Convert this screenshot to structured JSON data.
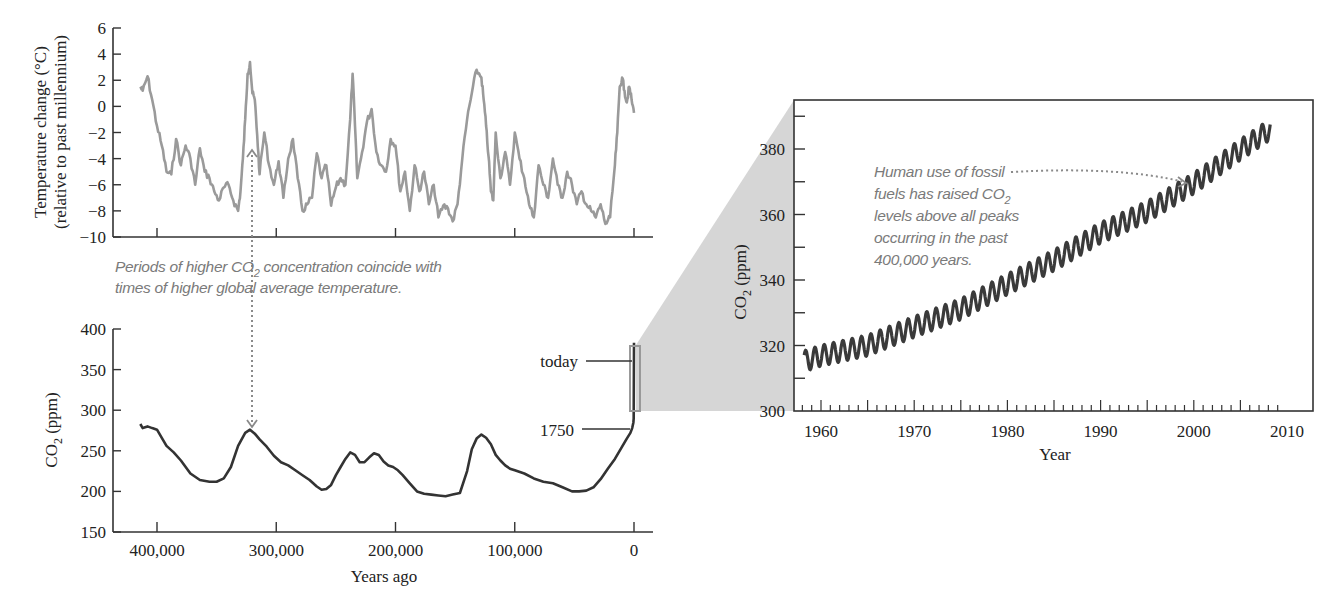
{
  "chart_data": [
    {
      "id": "temperature",
      "type": "line",
      "title": "",
      "xlabel": "",
      "ylabel": "Temperature change (°C)",
      "ylabel_line2": "(relative to past millennium)",
      "ylim": [
        -10,
        6
      ],
      "xlim": [
        425000,
        -5000
      ],
      "x_reversed": true,
      "yticks": [
        6,
        4,
        2,
        0,
        -2,
        -4,
        -6,
        -8,
        -10
      ],
      "ytick_labels": [
        "6",
        "4",
        "2",
        "0",
        "−2",
        "−4",
        "−6",
        "−8",
        "−10"
      ],
      "xticks": [
        400000,
        300000,
        200000,
        100000,
        0
      ],
      "grid": false,
      "line_color": "#9a9a9a",
      "x": [
        414000,
        412000,
        408000,
        404000,
        400000,
        396000,
        392000,
        388000,
        384000,
        380000,
        376000,
        372000,
        368000,
        364000,
        360000,
        356000,
        352000,
        348000,
        344000,
        340000,
        336000,
        332000,
        330000,
        328000,
        326000,
        324000,
        322000,
        320000,
        318000,
        316000,
        314000,
        310000,
        306000,
        302000,
        298000,
        294000,
        290000,
        286000,
        282000,
        278000,
        274000,
        270000,
        266000,
        262000,
        258000,
        254000,
        250000,
        246000,
        242000,
        238000,
        236000,
        234000,
        232000,
        228000,
        224000,
        220000,
        216000,
        212000,
        208000,
        204000,
        200000,
        196000,
        192000,
        188000,
        184000,
        180000,
        176000,
        172000,
        168000,
        164000,
        160000,
        156000,
        152000,
        148000,
        144000,
        140000,
        136000,
        132000,
        128000,
        126000,
        124000,
        122000,
        120000,
        118000,
        116000,
        112000,
        108000,
        104000,
        100000,
        96000,
        92000,
        88000,
        84000,
        80000,
        76000,
        72000,
        68000,
        64000,
        60000,
        56000,
        52000,
        48000,
        44000,
        40000,
        36000,
        32000,
        28000,
        24000,
        20000,
        16000,
        14000,
        12000,
        10000,
        8000,
        6000,
        4000,
        2000,
        0
      ],
      "values": [
        1.5,
        1.2,
        2.3,
        0.5,
        -1.5,
        -3,
        -5,
        -5.2,
        -2.5,
        -4.5,
        -3,
        -4,
        -6,
        -3.2,
        -5,
        -5.5,
        -6.5,
        -7.2,
        -6.2,
        -6,
        -7.2,
        -8,
        -6.5,
        -4,
        -1,
        2.5,
        3.4,
        1,
        0.5,
        -2.2,
        -5.2,
        -2,
        -4.5,
        -6,
        -4.2,
        -7,
        -4,
        -2.5,
        -5.5,
        -8,
        -7.5,
        -7,
        -3.6,
        -5.5,
        -4.5,
        -7.6,
        -6.2,
        -5.5,
        -6,
        -1,
        2.5,
        -1.5,
        -5.5,
        -3.5,
        -1.2,
        -0.2,
        -3.5,
        -4.5,
        -5,
        -2.5,
        -3,
        -6.5,
        -5,
        -8,
        -4.5,
        -6.5,
        -5,
        -7.5,
        -6,
        -8.5,
        -7.6,
        -7.8,
        -8.8,
        -7.5,
        -4,
        -1,
        1,
        2.8,
        2.2,
        0.5,
        -1.5,
        -3.8,
        -6.5,
        -7.2,
        -2,
        -5.5,
        -3.5,
        -6,
        -2,
        -4,
        -5.5,
        -7.5,
        -8.5,
        -4.5,
        -6,
        -7,
        -4,
        -6,
        -7,
        -5,
        -6,
        -7.5,
        -6.5,
        -7.5,
        -8,
        -8.5,
        -7.5,
        -9,
        -8.5,
        -4.5,
        -2,
        1.5,
        2.2,
        1.2,
        0.3,
        1.5,
        0.5,
        -0.5
      ]
    },
    {
      "id": "co2-paleo",
      "type": "line",
      "title": "",
      "xlabel": "Years ago",
      "ylabel": "CO2 (ppm)",
      "ylim": [
        150,
        400
      ],
      "xlim": [
        425000,
        -5000
      ],
      "x_reversed": true,
      "yticks": [
        400,
        350,
        300,
        250,
        200,
        150
      ],
      "xticks": [
        400000,
        300000,
        200000,
        100000,
        0
      ],
      "xtick_labels": [
        "400,000",
        "300,000",
        "200,000",
        "100,000",
        "0"
      ],
      "grid": false,
      "line_color": "#333333",
      "x": [
        414000,
        412000,
        408000,
        404000,
        400000,
        396000,
        392000,
        386000,
        380000,
        372000,
        364000,
        356000,
        350000,
        344000,
        338000,
        332000,
        326000,
        322000,
        318000,
        314000,
        308000,
        302000,
        296000,
        290000,
        284000,
        278000,
        272000,
        266000,
        262000,
        258000,
        254000,
        250000,
        246000,
        242000,
        238000,
        234000,
        230000,
        226000,
        222000,
        218000,
        214000,
        210000,
        206000,
        202000,
        198000,
        194000,
        188000,
        182000,
        176000,
        170000,
        164000,
        158000,
        152000,
        146000,
        140000,
        136000,
        132000,
        128000,
        124000,
        120000,
        116000,
        112000,
        108000,
        104000,
        100000,
        92000,
        84000,
        76000,
        68000,
        60000,
        52000,
        46000,
        40000,
        34000,
        28000,
        22000,
        16000,
        10000,
        6000,
        3000,
        1500,
        500,
        250
      ],
      "values": [
        283,
        278,
        280,
        278,
        276,
        266,
        256,
        248,
        238,
        222,
        214,
        212,
        212,
        216,
        230,
        256,
        272,
        276,
        271,
        264,
        255,
        244,
        236,
        232,
        226,
        220,
        214,
        206,
        202,
        203,
        208,
        220,
        230,
        240,
        248,
        245,
        236,
        236,
        242,
        247,
        245,
        237,
        232,
        230,
        226,
        220,
        210,
        200,
        197,
        196,
        195,
        194,
        196,
        198,
        225,
        252,
        265,
        270,
        266,
        258,
        245,
        238,
        232,
        228,
        226,
        222,
        216,
        212,
        210,
        205,
        200,
        200,
        201,
        205,
        215,
        228,
        240,
        255,
        265,
        272,
        278,
        285,
        290
      ],
      "callouts": [
        {
          "label": "today",
          "value": 383
        },
        {
          "label": "1750",
          "value": 278
        }
      ]
    },
    {
      "id": "co2-mauna-loa",
      "type": "line",
      "title": "",
      "xlabel": "Year",
      "ylabel": "CO2 (ppm)",
      "ylim": [
        300,
        390
      ],
      "xlim": [
        1957,
        2010
      ],
      "yticks": [
        300,
        310,
        320,
        330,
        340,
        350,
        360,
        370,
        380,
        390
      ],
      "ytick_labels": [
        "300",
        "",
        "320",
        "",
        "340",
        "",
        "360",
        "",
        "380",
        ""
      ],
      "xticks": [
        1960,
        1970,
        1980,
        1990,
        2000,
        2010
      ],
      "grid": false,
      "line_color": "#333333",
      "trend": {
        "x": [
          1958,
          1960,
          1965,
          1970,
          1975,
          1980,
          1985,
          1990,
          1995,
          2000,
          2005,
          2008
        ],
        "values": [
          315,
          316.9,
          320.0,
          325.7,
          331.1,
          338.7,
          346.0,
          354.4,
          360.9,
          369.5,
          379.8,
          385.6
        ]
      },
      "seasonal_amplitude_ppm": 3.2,
      "x_start": 1958.2,
      "x_end": 2008.2
    }
  ],
  "annotations": {
    "periods_note_line1": "Periods of higher CO",
    "periods_note_sub": "2",
    "periods_note_line1_rest": " concentration coincide with",
    "periods_note_line2": "times of higher global average temperature.",
    "human_note_line1": "Human use of fossil",
    "human_note_line2": "fuels has raised CO",
    "human_note_sub": "2",
    "human_note_line3": "levels above all peaks",
    "human_note_line4": "occurring in the past",
    "human_note_line5": "400,000 years."
  },
  "labels": {
    "temp_ylabel_1": "Temperature change (°C)",
    "temp_ylabel_2": "(relative to past millennium)",
    "co2_ylabel_main": "CO",
    "co2_ylabel_sub": "2",
    "co2_ylabel_rest": " (ppm)",
    "years_ago": "Years ago",
    "year": "Year",
    "today": "today",
    "y1750": "1750"
  },
  "colors": {
    "temperature_line": "#9a9a9a",
    "co2_line": "#333333",
    "note_text": "#7a7a7a",
    "zoom_wedge": "#d4d4d4",
    "axis": "#333333"
  }
}
